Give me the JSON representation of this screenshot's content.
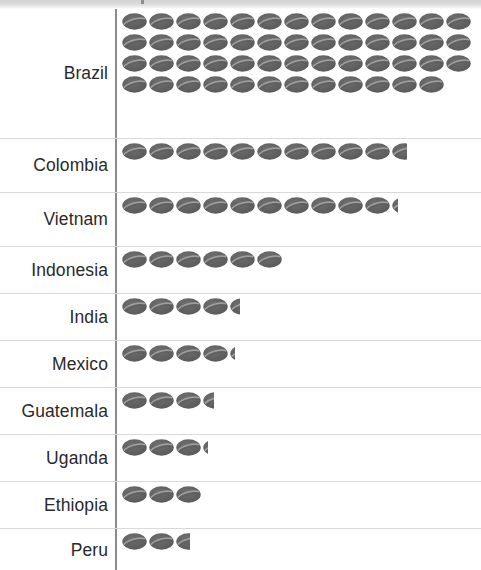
{
  "chart_data": {
    "type": "bar",
    "subtype": "pictogram",
    "title": "",
    "xlabel": "",
    "ylabel": "",
    "icon": "coffee-bean-icon",
    "icons_per_row": 10,
    "legend": [],
    "grid": false,
    "categories": [
      "Brazil",
      "Colombia",
      "Vietnam",
      "Indonesia",
      "India",
      "Mexico",
      "Guatemala",
      "Uganda",
      "Ethiopia",
      "Peru"
    ],
    "values": [
      51,
      10.6,
      10.25,
      6,
      4.4,
      4.2,
      3.45,
      3.2,
      3,
      2.55
    ],
    "xlim": [
      0,
      51
    ]
  },
  "chart": {
    "rows": [
      {
        "label": "Brazil",
        "full_icons": 51,
        "partial": 0,
        "row_height": 130
      },
      {
        "label": "Colombia",
        "full_icons": 10,
        "partial": 0.6,
        "row_height": 54
      },
      {
        "label": "Vietnam",
        "full_icons": 10,
        "partial": 0.25,
        "row_height": 54
      },
      {
        "label": "Indonesia",
        "full_icons": 6,
        "partial": 0,
        "row_height": 47
      },
      {
        "label": "India",
        "full_icons": 4,
        "partial": 0.4,
        "row_height": 47
      },
      {
        "label": "Mexico",
        "full_icons": 4,
        "partial": 0.2,
        "row_height": 47
      },
      {
        "label": "Guatemala",
        "full_icons": 3,
        "partial": 0.45,
        "row_height": 47
      },
      {
        "label": "Uganda",
        "full_icons": 3,
        "partial": 0.2,
        "row_height": 47
      },
      {
        "label": "Ethiopia",
        "full_icons": 3,
        "partial": 0,
        "row_height": 47
      },
      {
        "label": "Peru",
        "full_icons": 2,
        "partial": 0.55,
        "row_height": 42
      }
    ]
  },
  "colors": {
    "bean_fill": "#585858",
    "bean_fill_light": "#6e6e6e",
    "bean_crease": "#a8a8a8",
    "axis": "#8a8a8a",
    "divider": "#d9d9d9",
    "label_text": "#2a2a2a",
    "top_band": "#dcdcdc",
    "background": "#ffffff"
  }
}
